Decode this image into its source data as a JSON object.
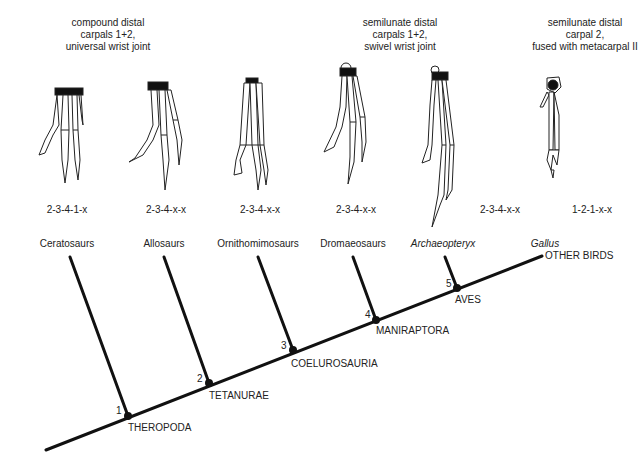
{
  "descriptions": [
    {
      "lines": [
        "compound distal",
        "carpals 1+2,",
        "universal wrist joint"
      ]
    },
    {
      "lines": [
        "semilunate distal",
        "carpals 1+2,",
        "swivel wrist joint"
      ]
    },
    {
      "lines": [
        "semilunate distal",
        "carpal 2,",
        "fused with metacarpal II"
      ]
    }
  ],
  "taxa": [
    {
      "name": "Ceratosaurs",
      "formula": "2-3-4-1-x",
      "italic": false
    },
    {
      "name": "Allosaurs",
      "formula": "2-3-4-x-x",
      "italic": false
    },
    {
      "name": "Ornithomimosaurs",
      "formula": "2-3-4-x-x",
      "italic": false
    },
    {
      "name": "Dromaeosaurs",
      "formula": "2-3-4-x-x",
      "italic": false
    },
    {
      "name": "Archaeopteryx",
      "formula": "2-3-4-x-x",
      "italic": true
    },
    {
      "name": "Gallus",
      "formula": "1-2-1-x-x",
      "italic": true
    }
  ],
  "nodes": [
    {
      "num": "1",
      "clade": "THEROPODA"
    },
    {
      "num": "2",
      "clade": "TETANURAE"
    },
    {
      "num": "3",
      "clade": "COELUROSAURIA"
    },
    {
      "num": "4",
      "clade": "MANIRAPTORA"
    },
    {
      "num": "5",
      "clade": "AVES"
    }
  ],
  "terminal_label": "OTHER BIRDS",
  "colors": {
    "line": "#111111",
    "text": "#222222",
    "background": "#ffffff"
  },
  "icons": [
    "ceratosaur-hand-icon",
    "allosaur-hand-icon",
    "ornithomimosaur-hand-icon",
    "dromaeosaur-hand-icon",
    "archaeopteryx-hand-icon",
    "gallus-hand-icon"
  ]
}
